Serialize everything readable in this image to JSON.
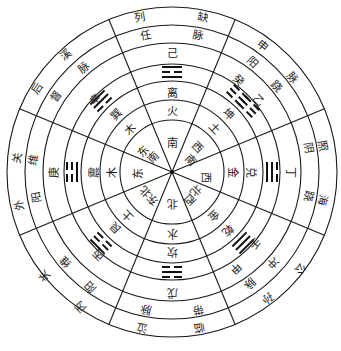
{
  "diagram": {
    "title": "",
    "center": {
      "x": 172,
      "y": 172
    },
    "radii": [
      165,
      147,
      129,
      108,
      91,
      72,
      52
    ],
    "divider_angles_deg": [
      -112.5,
      -67.5,
      -22.5,
      22.5,
      67.5,
      112.5,
      157.5,
      202.5
    ],
    "sectors": [
      {
        "direction": "南",
        "element": "火",
        "trigram_name": "离",
        "trigram_lines": [
          1,
          0,
          1
        ],
        "stem": "己",
        "vessel": [
          "任",
          "脉"
        ],
        "acupoint": [
          "列",
          "缺"
        ],
        "angle": -90
      },
      {
        "direction": "西南",
        "element": "土",
        "trigram_name": "坤",
        "trigram_lines": [
          0,
          0,
          0
        ],
        "stem": "乙",
        "vessel": [
          "阴",
          "跷"
        ],
        "acupoint": [
          "申",
          "脉"
        ],
        "angle": -45,
        "extra": "癸"
      },
      {
        "direction": "西",
        "element": "金",
        "trigram_name": "兑",
        "trigram_lines": [
          0,
          1,
          1
        ],
        "stem": "丁",
        "vessel": [
          "阴",
          "跷"
        ],
        "acupoint": [
          "照",
          "海"
        ],
        "angle": 0
      },
      {
        "direction": "西北",
        "element": "金",
        "trigram_name": "乾",
        "trigram_lines": [
          1,
          1,
          1
        ],
        "stem": "壬",
        "vessel": [
          "冲",
          "脉"
        ],
        "acupoint": [
          "公",
          "孙"
        ],
        "angle": 45,
        "extra2": [
          "甲",
          "辛"
        ]
      },
      {
        "direction": "北",
        "element": "水",
        "trigram_name": "坎",
        "trigram_lines": [
          0,
          1,
          0
        ],
        "stem": "戊",
        "vessel": [
          "带",
          "脉"
        ],
        "acupoint": [
          "临",
          "泣"
        ],
        "angle": 90
      },
      {
        "direction": "东北",
        "element": "土",
        "trigram_name": "艮",
        "trigram_lines": [
          1,
          0,
          0
        ],
        "stem": "丙",
        "vessel": [
          "阳",
          "维"
        ],
        "acupoint": [
          "外",
          "关"
        ],
        "angle": 135,
        "extra": "丙"
      },
      {
        "direction": "东",
        "element": "木",
        "trigram_name": "震",
        "trigram_lines": [
          0,
          0,
          1
        ],
        "stem": "庚",
        "vessel": [
          "阳",
          "维"
        ],
        "acupoint": [
          "外",
          "关"
        ],
        "angle": 180
      },
      {
        "direction": "东南",
        "element": "木",
        "trigram_name": "巽",
        "trigram_lines": [
          1,
          1,
          0
        ],
        "stem": "辛",
        "vessel": [
          "督",
          "脉"
        ],
        "acupoint": [
          "后",
          "溪"
        ],
        "angle": -135
      }
    ],
    "labels": [
      {
        "text": "南",
        "x": 172,
        "y": 143
      },
      {
        "text": "西",
        "x": 197,
        "y": 147,
        "rot": 45
      },
      {
        "text": "南",
        "x": 190,
        "y": 160,
        "rot": 45
      },
      {
        "text": "西",
        "x": 205,
        "y": 177,
        "rot": 90
      },
      {
        "text": "北",
        "x": 196,
        "y": 190,
        "rot": 135
      },
      {
        "text": "西",
        "x": 190,
        "y": 199,
        "rot": 135
      },
      {
        "text": "北",
        "x": 172,
        "y": 203,
        "rot": 180
      },
      {
        "text": "东",
        "x": 153,
        "y": 200,
        "rot": -135
      },
      {
        "text": "北",
        "x": 146,
        "y": 192,
        "rot": -135
      },
      {
        "text": "东",
        "x": 138,
        "y": 173,
        "rot": -90
      },
      {
        "text": "东",
        "x": 143,
        "y": 152,
        "rot": -45
      },
      {
        "text": "南",
        "x": 153,
        "y": 158,
        "rot": -45
      },
      {
        "text": "火",
        "x": 172,
        "y": 111
      },
      {
        "text": "土",
        "x": 214,
        "y": 128,
        "rot": 45
      },
      {
        "text": "金",
        "x": 232,
        "y": 172,
        "rot": 90
      },
      {
        "text": "金",
        "x": 214,
        "y": 215,
        "rot": 135
      },
      {
        "text": "水",
        "x": 172,
        "y": 233,
        "rot": 180
      },
      {
        "text": "土",
        "x": 128,
        "y": 216,
        "rot": -135
      },
      {
        "text": "木",
        "x": 112,
        "y": 172,
        "rot": -90
      },
      {
        "text": "木",
        "x": 130,
        "y": 130,
        "rot": -45
      },
      {
        "text": "离",
        "x": 172,
        "y": 93
      },
      {
        "text": "坤",
        "x": 228,
        "y": 114,
        "rot": 45
      },
      {
        "text": "兑",
        "x": 250,
        "y": 172,
        "rot": 90
      },
      {
        "text": "乾",
        "x": 228,
        "y": 230,
        "rot": 135
      },
      {
        "text": "坎",
        "x": 172,
        "y": 251,
        "rot": 180
      },
      {
        "text": "艮",
        "x": 116,
        "y": 228,
        "rot": -135
      },
      {
        "text": "震",
        "x": 94,
        "y": 172,
        "rot": -90
      },
      {
        "text": "巽",
        "x": 116,
        "y": 115,
        "rot": -45
      },
      {
        "text": "己",
        "x": 172,
        "y": 53
      },
      {
        "text": "乙",
        "x": 258,
        "y": 100,
        "rot": 45
      },
      {
        "text": "癸",
        "x": 238,
        "y": 80,
        "rot": 45
      },
      {
        "text": "丁",
        "x": 290,
        "y": 172,
        "rot": 90
      },
      {
        "text": "壬",
        "x": 255,
        "y": 243,
        "rot": 135
      },
      {
        "text": "甲",
        "x": 236,
        "y": 268,
        "rot": 135
      },
      {
        "text": "戊",
        "x": 172,
        "y": 292,
        "rot": 180
      },
      {
        "text": "丙",
        "x": 99,
        "y": 255,
        "rot": -135
      },
      {
        "text": "庚",
        "x": 54,
        "y": 172,
        "rot": -90
      },
      {
        "text": "辛",
        "x": 95,
        "y": 100,
        "rot": -45
      },
      {
        "text": "任",
        "x": 146,
        "y": 36,
        "rot": -10
      },
      {
        "text": "脉",
        "x": 198,
        "y": 36,
        "rot": 10
      },
      {
        "text": "阳",
        "x": 252,
        "y": 62,
        "rot": 45
      },
      {
        "text": "跷",
        "x": 276,
        "y": 86,
        "rot": 45
      },
      {
        "text": "阴",
        "x": 308,
        "y": 148,
        "rot": 80
      },
      {
        "text": "跷",
        "x": 308,
        "y": 196,
        "rot": 100
      },
      {
        "text": "冲",
        "x": 273,
        "y": 262,
        "rot": 135
      },
      {
        "text": "脉",
        "x": 250,
        "y": 283,
        "rot": 135
      },
      {
        "text": "带",
        "x": 198,
        "y": 309,
        "rot": 170
      },
      {
        "text": "脉",
        "x": 146,
        "y": 309,
        "rot": -170
      },
      {
        "text": "阳",
        "x": 91,
        "y": 287,
        "rot": -135
      },
      {
        "text": "维",
        "x": 66,
        "y": 262,
        "rot": -135
      },
      {
        "text": "阳",
        "x": 37,
        "y": 197,
        "rot": -100
      },
      {
        "text": "维",
        "x": 34,
        "y": 160,
        "rot": -80
      },
      {
        "text": "督",
        "x": 56,
        "y": 96,
        "rot": -55
      },
      {
        "text": "脉",
        "x": 84,
        "y": 68,
        "rot": -40
      },
      {
        "text": "列",
        "x": 140,
        "y": 18,
        "rot": -10
      },
      {
        "text": "缺",
        "x": 203,
        "y": 18,
        "rot": 10
      },
      {
        "text": "申",
        "x": 262,
        "y": 46,
        "rot": 40
      },
      {
        "text": "脉",
        "x": 292,
        "y": 78,
        "rot": 50
      },
      {
        "text": "照",
        "x": 322,
        "y": 146,
        "rot": 80
      },
      {
        "text": "海",
        "x": 322,
        "y": 200,
        "rot": 100
      },
      {
        "text": "公",
        "x": 300,
        "y": 268,
        "rot": 130
      },
      {
        "text": "孙",
        "x": 268,
        "y": 298,
        "rot": 145
      },
      {
        "text": "临",
        "x": 199,
        "y": 327,
        "rot": 170
      },
      {
        "text": "泣",
        "x": 142,
        "y": 327,
        "rot": -170
      },
      {
        "text": "丙",
        "x": 81,
        "y": 307,
        "rot": -135
      },
      {
        "text": "关",
        "x": 45,
        "y": 276,
        "rot": -135
      },
      {
        "text": "外",
        "x": 20,
        "y": 205,
        "rot": -100
      },
      {
        "text": "关",
        "x": 18,
        "y": 158,
        "rot": -80
      },
      {
        "text": "后",
        "x": 37,
        "y": 88,
        "rot": -55
      },
      {
        "text": "溪",
        "x": 66,
        "y": 55,
        "rot": -40
      }
    ],
    "trigrams": [
      {
        "name": "离",
        "x": 172,
        "y": 72,
        "rot": 0,
        "lines": [
          1,
          0,
          1
        ]
      },
      {
        "name": "坤",
        "x": 243,
        "y": 101,
        "rot": 45,
        "lines": [
          0,
          0,
          0
        ],
        "pair": true
      },
      {
        "name": "兑",
        "x": 272,
        "y": 172,
        "rot": 90,
        "lines": [
          0,
          1,
          1
        ]
      },
      {
        "name": "乾",
        "x": 243,
        "y": 243,
        "rot": 135,
        "lines": [
          1,
          1,
          1
        ]
      },
      {
        "name": "坎",
        "x": 172,
        "y": 272,
        "rot": 180,
        "lines": [
          0,
          1,
          0
        ]
      },
      {
        "name": "艮",
        "x": 101,
        "y": 243,
        "rot": -135,
        "lines": [
          1,
          0,
          0
        ]
      },
      {
        "name": "震",
        "x": 72,
        "y": 172,
        "rot": -90,
        "lines": [
          0,
          0,
          1
        ]
      },
      {
        "name": "巽",
        "x": 101,
        "y": 101,
        "rot": -45,
        "lines": [
          1,
          1,
          0
        ]
      }
    ]
  }
}
